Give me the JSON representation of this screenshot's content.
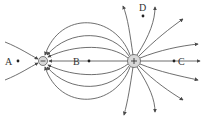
{
  "diagram": {
    "charges": [
      {
        "id": "negative",
        "sign": "−",
        "x": 43,
        "y": 61,
        "r": 4.5
      },
      {
        "id": "positive",
        "sign": "+",
        "x": 134,
        "y": 61,
        "r": 6.5
      }
    ],
    "points": [
      {
        "label": "A",
        "x": 18,
        "y": 61,
        "lx": 5,
        "ly": 65
      },
      {
        "label": "B",
        "x": 89,
        "y": 61,
        "lx": 73,
        "ly": 65
      },
      {
        "label": "C",
        "x": 174,
        "y": 61,
        "lx": 178,
        "ly": 65
      },
      {
        "label": "D",
        "x": 143,
        "y": 16,
        "lx": 139,
        "ly": 11
      }
    ],
    "colors": {
      "line": "#4a4a4a",
      "charge_fill": "#d9d9d9"
    }
  }
}
